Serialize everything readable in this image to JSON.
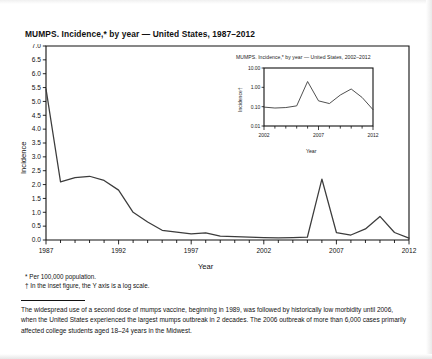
{
  "figure": {
    "title": "MUMPS. Incidence,* by year — United States, 1987–2012",
    "axis_y_label": "Incidence",
    "axis_x_label": "Year"
  },
  "inset": {
    "title": "MUMPS. Incidence,* by year — United States, 2002–2012",
    "axis_y_label": "Incidence†",
    "axis_x_label": "Year"
  },
  "footnotes": {
    "line1": "* Per 100,000 population.",
    "line2": "† In the inset figure, the Y axis is a log scale."
  },
  "caption": {
    "text": "The widespread use of a second dose of mumps vaccine, beginning in 1989, was followed by historically low morbidity until 2006, when the United States experienced the largest mumps outbreak in 2 decades. The 2006 outbreak of more than 6,000 cases primarily affected college students aged 18–24 years in the Midwest."
  },
  "colors": {
    "line": "#3c3c3c",
    "axis": "#111111",
    "background": "#ffffff"
  },
  "chart_data": [
    {
      "id": "main",
      "type": "line",
      "title": "MUMPS. Incidence,* by year — United States, 1987–2012",
      "xlabel": "Year",
      "ylabel": "Incidence",
      "xlim": [
        1987,
        2012
      ],
      "ylim": [
        0.0,
        7.0
      ],
      "ytick_values": [
        0.0,
        0.5,
        1.0,
        1.5,
        2.0,
        2.5,
        3.0,
        3.5,
        4.0,
        4.5,
        5.0,
        5.5,
        6.0,
        6.5,
        7.0
      ],
      "ytick_labels": [
        "0.0",
        "0.5",
        "1.0",
        "1.5",
        "2.0",
        "2.5",
        "3.0",
        "3.5",
        "4.0",
        "4.5",
        "5.0",
        "5.5",
        "6.0",
        "6.5",
        "7.0"
      ],
      "xtick_values": [
        1987,
        1992,
        1997,
        2002,
        2007,
        2012
      ],
      "xtick_labels": [
        "1987",
        "1992",
        "1997",
        "2002",
        "2007",
        "2012"
      ],
      "grid": false,
      "legend": "none",
      "x": [
        1987,
        1988,
        1989,
        1990,
        1991,
        1992,
        1993,
        1994,
        1995,
        1996,
        1997,
        1998,
        1999,
        2000,
        2001,
        2002,
        2003,
        2004,
        2005,
        2006,
        2007,
        2008,
        2009,
        2010,
        2011,
        2012
      ],
      "values": [
        5.45,
        2.1,
        2.25,
        2.3,
        2.15,
        1.8,
        1.0,
        0.65,
        0.35,
        0.28,
        0.22,
        0.26,
        0.14,
        0.12,
        0.1,
        0.09,
        0.08,
        0.09,
        0.1,
        2.2,
        0.27,
        0.18,
        0.4,
        0.85,
        0.27,
        0.07
      ]
    },
    {
      "id": "inset",
      "type": "line",
      "title": "MUMPS. Incidence,* by year — United States, 2002–2012",
      "xlabel": "Year",
      "ylabel": "Incidence†",
      "xlim": [
        2002,
        2012
      ],
      "ylim": [
        0.01,
        10.0
      ],
      "yscale": "log",
      "ytick_values": [
        0.01,
        0.1,
        1.0,
        10.0
      ],
      "ytick_labels": [
        "0.01",
        "0.10",
        "1.00",
        "10.00"
      ],
      "xtick_values": [
        2002,
        2007,
        2012
      ],
      "xtick_labels": [
        "2002",
        "2007",
        "2012"
      ],
      "grid": false,
      "legend": "none",
      "x": [
        2002,
        2003,
        2004,
        2005,
        2006,
        2007,
        2008,
        2009,
        2010,
        2011,
        2012
      ],
      "values": [
        0.095,
        0.085,
        0.09,
        0.11,
        2.0,
        0.2,
        0.145,
        0.4,
        0.82,
        0.3,
        0.07
      ]
    }
  ]
}
